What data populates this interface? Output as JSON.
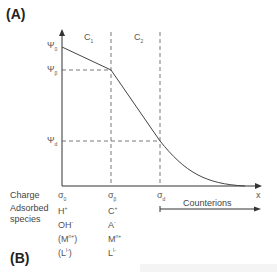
{
  "panels": {
    "a": "(A)",
    "b": "(B)"
  },
  "regions": {
    "c1": "C",
    "c1_sub": "1",
    "c2": "C",
    "c2_sub": "2"
  },
  "potentials": {
    "psi0": "Ψ",
    "psi0_sub": "0",
    "psib": "Ψ",
    "psib_sub": "β",
    "psid": "Ψ",
    "psid_sub": "d"
  },
  "axis": {
    "x_label": "x"
  },
  "charge_row": {
    "label": "Charge",
    "sigma0": "σ",
    "sigma0_sub": "0",
    "sigmab": "σ",
    "sigmab_sub": "β",
    "sigmad": "σ",
    "sigmad_sub": "d"
  },
  "counterions": {
    "label": "Counterions"
  },
  "adsorbed": {
    "label_line1": "Adsorbed",
    "label_line2": "species",
    "col0": [
      {
        "base": "H",
        "sup": "+"
      },
      {
        "base": "OH",
        "sup": "-"
      },
      {
        "base": "(M",
        "sup": "n+",
        "tail": ")"
      },
      {
        "base": "(L",
        "sup": "l-",
        "tail": ")"
      }
    ],
    "col_beta": [
      {
        "base": "C",
        "sup": "+"
      },
      {
        "base": "A",
        "sup": "-"
      },
      {
        "base": "M",
        "sup": "n+"
      },
      {
        "base": "L",
        "sup": "l-"
      }
    ]
  }
}
